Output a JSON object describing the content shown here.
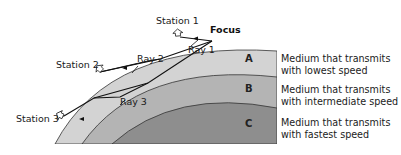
{
  "diagram": {
    "focus_label": "Focus",
    "stations": [
      {
        "label": "Station 1"
      },
      {
        "label": "Station 2"
      },
      {
        "label": "Station 3"
      }
    ],
    "rays": [
      {
        "label": "Ray 1"
      },
      {
        "label": "Ray 2"
      },
      {
        "label": "Ray 3"
      }
    ],
    "layers": [
      {
        "letter": "A",
        "line1": "Medium that transmits",
        "line2": "with lowest speed",
        "color": "#d3d3d3"
      },
      {
        "letter": "B",
        "line1": "Medium that transmits",
        "line2": "with intermediate speed",
        "color": "#b4b4b4"
      },
      {
        "letter": "C",
        "line1": "Medium that transmits",
        "line2": "with fastest speed",
        "color": "#8e8e8e"
      }
    ]
  }
}
